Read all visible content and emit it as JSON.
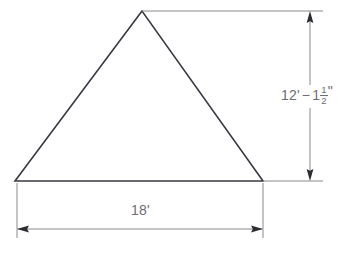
{
  "drawing": {
    "title": "Triangle elevation with dimensions",
    "background_color": "#ffffff",
    "shape_color": "#3a3a44",
    "dimension_color": "#8a8a8f",
    "text_color": "#6e6e73",
    "shape": {
      "name": "triangle",
      "vertices": [
        {
          "label": "apex",
          "x": 142,
          "y": 11
        },
        {
          "label": "bottom-left",
          "x": 15,
          "y": 181
        },
        {
          "label": "bottom-right",
          "x": 263,
          "y": 181
        }
      ],
      "path": "M 142 11 L 15 181 L 263 181 Z"
    },
    "dimensions": {
      "vertical": {
        "name": "height-dimension",
        "value_feet": "12'",
        "separator": "−",
        "value_inches_whole": "1",
        "fraction_numerator": "1",
        "fraction_denominator": "2",
        "inch_mark": "\"",
        "full_text": "12'−1 1/2\"",
        "line_x": 310,
        "top_y": 11,
        "bottom_y": 181,
        "gap_top": 85,
        "gap_bottom": 108,
        "extension_end_x": 323
      },
      "horizontal": {
        "name": "width-dimension",
        "label": "18'",
        "line_y": 229,
        "left_x": 17,
        "right_x": 262,
        "extension_end_y": 238
      }
    }
  }
}
